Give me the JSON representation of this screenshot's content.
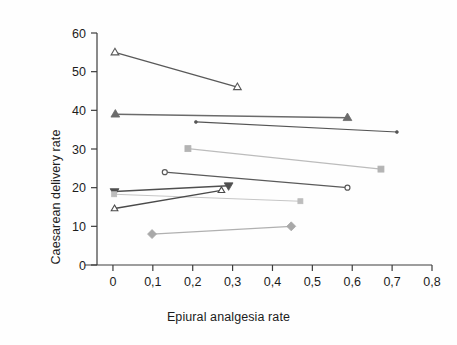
{
  "chart_data": {
    "type": "scatter",
    "title": "",
    "xlabel": "Epiural analgesia rate",
    "ylabel": "Caesarean delivery rate",
    "xlim": [
      -0.04,
      0.8
    ],
    "ylim": [
      0,
      60
    ],
    "xticks": [
      0,
      0.1,
      0.2,
      0.3,
      0.4,
      0.5,
      0.6,
      0.7,
      0.8
    ],
    "xticklabels": [
      "0",
      "0,1",
      "0,2",
      "0,3",
      "0,4",
      "0,5",
      "0,6",
      "0,7",
      "0,8"
    ],
    "yticks": [
      0,
      10,
      20,
      30,
      40,
      50,
      60
    ],
    "yticklabels": [
      "0",
      "10",
      "20",
      "30",
      "40",
      "50",
      "60"
    ],
    "grid": false,
    "legend": "none",
    "decimal_separator": ",",
    "series": [
      {
        "name": "open-triangle-up-dark",
        "marker": "triangle-up-open",
        "color": "#595959",
        "line_color": "#595959",
        "line_width": 1.3,
        "marker_size": 7,
        "x": [
          0.005,
          0.312
        ],
        "y": [
          55.0,
          46.0
        ]
      },
      {
        "name": "filled-triangle-up-dark",
        "marker": "triangle-up-filled",
        "color": "#6b6b6b",
        "line_color": "#6b6b6b",
        "line_width": 1.5,
        "marker_size": 8,
        "x": [
          0.006,
          0.588
        ],
        "y": [
          39.0,
          38.1
        ]
      },
      {
        "name": "small-dot-dark",
        "marker": "dot",
        "color": "#555555",
        "line_color": "#555555",
        "line_width": 1.2,
        "marker_size": 3,
        "x": [
          0.208,
          0.712
        ],
        "y": [
          37.0,
          34.4
        ]
      },
      {
        "name": "square-light-upper",
        "marker": "square-filled",
        "color": "#b4b4b4",
        "line_color": "#bcbcbc",
        "line_width": 1.2,
        "marker_size": 6,
        "x": [
          0.188,
          0.672
        ],
        "y": [
          30.1,
          24.8
        ]
      },
      {
        "name": "open-circle-dark",
        "marker": "circle-open",
        "color": "#5a5a5a",
        "line_color": "#5a5a5a",
        "line_width": 1.2,
        "marker_size": 5,
        "x": [
          0.13,
          0.588
        ],
        "y": [
          24.0,
          20.0
        ]
      },
      {
        "name": "filled-triangle-down-dark",
        "marker": "triangle-down-filled",
        "color": "#4f4f4f",
        "line_color": "#4f4f4f",
        "line_width": 1.6,
        "marker_size": 8,
        "x": [
          0.004,
          0.29
        ],
        "y": [
          19.0,
          20.5
        ]
      },
      {
        "name": "square-light-lower",
        "marker": "square-filled",
        "color": "#bdbdbd",
        "line_color": "#c6c6c6",
        "line_width": 1.1,
        "marker_size": 5,
        "x": [
          0.003,
          0.47
        ],
        "y": [
          18.3,
          16.5
        ]
      },
      {
        "name": "open-triangle-up-rising",
        "marker": "triangle-up-open",
        "color": "#4a4a4a",
        "line_color": "#4a4a4a",
        "line_width": 1.4,
        "marker_size": 6,
        "x": [
          0.004,
          0.272
        ],
        "y": [
          14.6,
          19.3
        ]
      },
      {
        "name": "diamond-gray",
        "marker": "diamond-filled",
        "color": "#a8a8a8",
        "line_color": "#b0b0b0",
        "line_width": 1.2,
        "marker_size": 9,
        "x": [
          0.098,
          0.447
        ],
        "y": [
          8.0,
          10.0
        ]
      }
    ]
  },
  "axis": {
    "line_color": "#3c3c3c",
    "tick_color": "#3c3c3c"
  }
}
